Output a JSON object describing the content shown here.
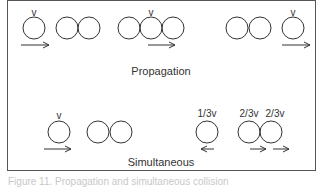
{
  "figure": {
    "sections": {
      "propagation": {
        "title": "Propagation",
        "frames": [
          {
            "balls": 1,
            "velocity_label": "v",
            "moving_ball": 0,
            "arrow": "right"
          },
          {
            "balls": 2,
            "velocity_label": "",
            "moving_ball": null,
            "arrow": null
          },
          {
            "balls": 3,
            "velocity_label": "v",
            "moving_ball": 1,
            "arrow": "right"
          },
          {
            "balls": 2,
            "velocity_label": "",
            "moving_ball": null,
            "arrow": null
          },
          {
            "balls": 1,
            "velocity_label": "v",
            "moving_ball": 0,
            "arrow": "right"
          }
        ]
      },
      "simultaneous": {
        "title": "Simultaneous",
        "frames": [
          {
            "balls": 1,
            "velocity_label": "v",
            "arrow": "right"
          },
          {
            "balls": 2,
            "velocity_label": "",
            "arrow": null
          },
          {
            "balls": 1,
            "velocity_label": "1/3v",
            "arrow": "left"
          },
          {
            "balls": 2,
            "velocity_labels": [
              "2/3v",
              "2/3v"
            ],
            "arrows": [
              "right",
              "right"
            ]
          }
        ]
      }
    },
    "labels": {
      "v1": "v",
      "v2": "v",
      "v3": "v",
      "v4": "v",
      "one_third": "1/3v",
      "two_third_a": "2/3v",
      "two_third_b": "2/3v"
    },
    "caption": "Figure 11. Propagation and simultaneous collision"
  },
  "colors": {
    "stroke": "#333333",
    "frame": "#555555",
    "background": "#ffffff"
  }
}
